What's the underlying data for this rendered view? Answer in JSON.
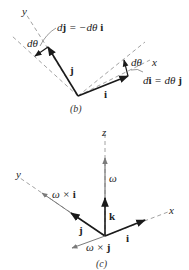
{
  "figure_b": {
    "caption": "(b)",
    "axis_x": "x",
    "axis_y": "y",
    "vector_i": "i",
    "vector_j": "j",
    "angle_top": "dθ",
    "angle_right": "dθ",
    "eq_dj_left": "d",
    "eq_dj_bold": "j",
    "eq_dj_rest": " = −dθ ",
    "eq_dj_bold2": "i",
    "eq_di_left": "d",
    "eq_di_bold": "i",
    "eq_di_rest": " = dθ ",
    "eq_di_bold2": "j"
  },
  "figure_c": {
    "caption": "(c)",
    "axis_x": "x",
    "axis_y": "y",
    "axis_z": "z",
    "omega": "ω",
    "vector_k": "k",
    "vector_i": "i",
    "vector_j": "j",
    "omega_x_i_pre": "ω × ",
    "omega_x_i_bold": "i",
    "omega_x_j_pre": "ω × ",
    "omega_x_j_bold": "j"
  },
  "colors": {
    "vector": "#1a1a1a",
    "dashed": "#8a8a8a",
    "gray_arrow": "#7a7a7a"
  }
}
